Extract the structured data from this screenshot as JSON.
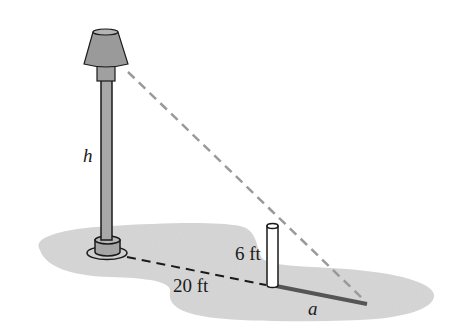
{
  "diagram": {
    "type": "geometry-word-problem-figure",
    "labels": {
      "lamp_height": "h",
      "post_height": "6 ft",
      "distance": "20 ft",
      "shadow_length": "a"
    },
    "colors": {
      "background": "#ffffff",
      "ground": "#d6d6d6",
      "lamp_fill": "#9a9a9a",
      "pole_fill": "#a8a8a8",
      "outline": "#1a1a1a",
      "light_ray": "#9a9a9a",
      "shadow": "#555555",
      "post_fill": "#ffffff"
    },
    "elements": [
      {
        "name": "lamp-shade",
        "shape": "truncated-cone"
      },
      {
        "name": "lamp-pole",
        "shape": "vertical-rod"
      },
      {
        "name": "lamp-base",
        "shape": "cylinder-on-disc"
      },
      {
        "name": "post",
        "shape": "white-cylinder"
      },
      {
        "name": "ground-line",
        "style": "dashed-black"
      },
      {
        "name": "light-ray",
        "style": "dashed-gray"
      },
      {
        "name": "shadow",
        "style": "solid-dark-thick"
      },
      {
        "name": "ground",
        "style": "gray-blob"
      }
    ]
  }
}
